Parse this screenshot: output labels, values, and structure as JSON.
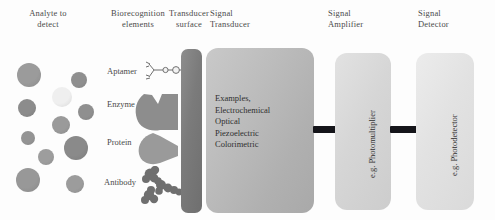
{
  "figure": {
    "headers": [
      {
        "name": "analyte",
        "line1": "Analyte to",
        "line2": "detect"
      },
      {
        "name": "biorecognition",
        "line1": "Biorecognition",
        "line2": "elements"
      },
      {
        "name": "transducer-surface",
        "line1": "Transducer",
        "line2": "surface"
      },
      {
        "name": "signal-transducer",
        "line1": "Signal",
        "line2": "Transducer"
      },
      {
        "name": "signal-amplifier",
        "line1": "Signal",
        "line2": "Amplifier"
      },
      {
        "name": "signal-detector",
        "line1": "Signal",
        "line2": "Detector"
      }
    ],
    "biorecognition_elements": [
      {
        "label": "Aptamer"
      },
      {
        "label": "Enzyme"
      },
      {
        "label": "Protein"
      },
      {
        "label": "Antibody"
      }
    ],
    "transducer_examples": [
      "Examples,",
      "Electrochemical",
      "Optical",
      "Piezoelectric",
      "Colorimetric"
    ],
    "amplifier_label": "e.g. Photomultiplier",
    "detector_label": "e.g. Photodetector",
    "analyte_particles": [
      {
        "cx": 29,
        "cy": 75,
        "r": 12,
        "color": "#9b9b9b"
      },
      {
        "cx": 79,
        "cy": 80,
        "r": 8,
        "color": "#8f8f8f"
      },
      {
        "cx": 62,
        "cy": 97,
        "r": 10,
        "color": "#efefef"
      },
      {
        "cx": 27,
        "cy": 108,
        "r": 9,
        "color": "#8c8c8c"
      },
      {
        "cx": 86,
        "cy": 112,
        "r": 8,
        "color": "#8f8f8f"
      },
      {
        "cx": 61,
        "cy": 125,
        "r": 9,
        "color": "#9a9a9a"
      },
      {
        "cx": 28,
        "cy": 138,
        "r": 7,
        "color": "#949494"
      },
      {
        "cx": 76,
        "cy": 148,
        "r": 12,
        "color": "#8a8a8a"
      },
      {
        "cx": 46,
        "cy": 157,
        "r": 8,
        "color": "#9d9d9d"
      },
      {
        "cx": 28,
        "cy": 180,
        "r": 12,
        "color": "#989898"
      },
      {
        "cx": 75,
        "cy": 184,
        "r": 9,
        "color": "#9c9c9c"
      }
    ],
    "colors": {
      "surface": "#7b7b7b",
      "panel_transducer": "#bcbcbc",
      "panel_amplifier": "#d6d6d6",
      "panel_detector": "#e2e2e2",
      "connector": "#15151a",
      "biomolecule": "#8b8b8b",
      "background": "#fdfdfd"
    }
  }
}
